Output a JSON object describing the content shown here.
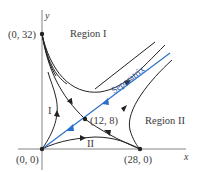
{
  "diagram": {
    "type": "phase-plane",
    "axes": {
      "x_label": "x",
      "y_label": "y"
    },
    "equilibria": [
      {
        "label": "(0, 32)",
        "x": 0,
        "y": 32
      },
      {
        "label": "(0, 0)",
        "x": 0,
        "y": 0
      },
      {
        "label": "(28, 0)",
        "x": 28,
        "y": 0
      },
      {
        "label": "(12, 8)",
        "x": 12,
        "y": 8
      }
    ],
    "regions": [
      {
        "label": "Region I"
      },
      {
        "label": "Region II"
      }
    ],
    "subregion_labels": [
      "I",
      "II"
    ],
    "separatrix_label": "Separatrix",
    "colors": {
      "separatrix": "#2a6fc9",
      "trajectories": "#222222",
      "axes": "#777777",
      "text": "#3a3a3a"
    }
  }
}
